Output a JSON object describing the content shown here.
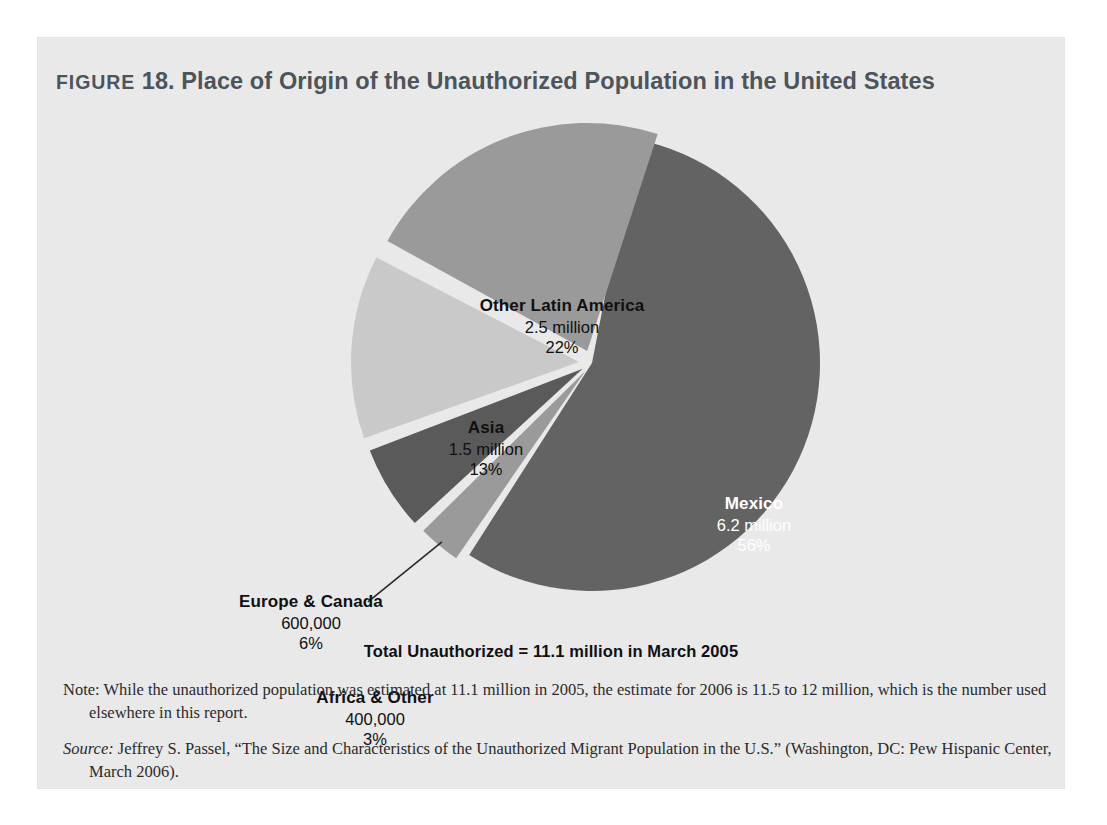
{
  "figure": {
    "label_word": "FIGURE",
    "number": "18.",
    "title": "Place of Origin of the Unauthorized Population in the United States",
    "title_full": "FIGURE 18. Place of Origin of the Unauthorized Population in the United States"
  },
  "total_caption": "Total Unauthorized = 11.1 million in March 2005",
  "footnotes": {
    "note_lead": "Note:",
    "note_text": " While the unauthorized population was estimated at 11.1 million in 2005, the estimate for 2006 is 11.5 to 12 million, which is the number used elsewhere in this report.",
    "source_lead": "Source:",
    "source_text": " Jeffrey S. Passel, “The Size and Characteristics of the Unauthorized Migrant Population in the U.S.” (Washington, DC: Pew Hispanic Center, March 2006)."
  },
  "colors": {
    "page_background": "#ffffff",
    "panel_background": "#e9e9e9",
    "title": "#4c545c",
    "text_dark": "#101010",
    "text_light": "#ffffff",
    "slice_dark": "#636363",
    "slice_darker": "#5a5a5a",
    "slice_medium": "#9a9a9a",
    "slice_light": "#c9c9c9",
    "leader_line": "#2a2a2a"
  },
  "chart_data": {
    "type": "pie",
    "title": "Place of Origin of the Unauthorized Population in the United States",
    "total_label": "Total Unauthorized = 11.1 million in March 2005",
    "total_value": 11.1,
    "units": "million people",
    "legend": "none (labels placed on/near slices)",
    "grid": false,
    "categories": [
      "Mexico",
      "Other Latin America",
      "Asia",
      "Europe & Canada",
      "Africa & Other"
    ],
    "values": [
      6.2,
      2.5,
      1.5,
      0.6,
      0.4
    ],
    "percentages": [
      56,
      22,
      13,
      6,
      3
    ],
    "slices": [
      {
        "name": "Mexico",
        "value_label": "6.2 million",
        "value": 6.2,
        "percent": 56,
        "percent_label": "56%",
        "color": "#636363",
        "label_on_slice": true,
        "exploded": false,
        "start_deg": 11,
        "sweep_deg": 201.6,
        "explode_px": 0,
        "leader_line": false
      },
      {
        "name": "Africa & Other",
        "value_label": "400,000",
        "value": 0.4,
        "percent": 3,
        "percent_label": "3%",
        "color": "#9a9a9a",
        "label_on_slice": false,
        "exploded": true,
        "start_deg": 214.6,
        "sweep_deg": 10.8,
        "explode_px": 10,
        "leader_line": true
      },
      {
        "name": "Europe & Canada",
        "value_label": "600,000",
        "value": 0.6,
        "percent": 6,
        "percent_label": "6%",
        "color": "#5a5a5a",
        "label_on_slice": false,
        "exploded": true,
        "start_deg": 227.4,
        "sweep_deg": 21.6,
        "explode_px": 11,
        "leader_line": false
      },
      {
        "name": "Asia",
        "value_label": "1.5 million",
        "value": 1.5,
        "percent": 13,
        "percent_label": "13%",
        "color": "#c9c9c9",
        "label_on_slice": false,
        "exploded": true,
        "start_deg": 250.5,
        "sweep_deg": 46.8,
        "explode_px": 13,
        "leader_line": false
      },
      {
        "name": "Other Latin America",
        "value_label": "2.5 million",
        "value": 2.5,
        "percent": 22,
        "percent_label": "22%",
        "color": "#9a9a9a",
        "label_on_slice": false,
        "exploded": true,
        "start_deg": 298.8,
        "sweep_deg": 79.2,
        "explode_px": 13,
        "leader_line": false
      }
    ],
    "geometry": {
      "center_x": 554,
      "center_y": 253,
      "radius": 228
    }
  }
}
